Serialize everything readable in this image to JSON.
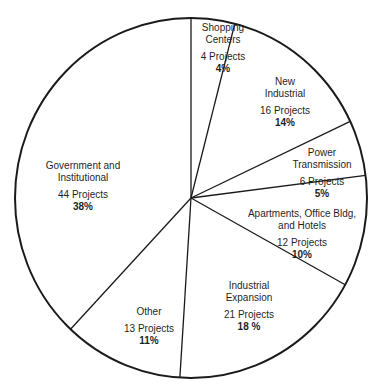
{
  "chart_data": {
    "type": "pie",
    "title": "",
    "start_angle_deg": 0,
    "direction": "clockwise",
    "slices": [
      {
        "label": "Shopping Centers",
        "projects": 4,
        "percent": 4,
        "count_text": "4 Projects",
        "pct_text": "4%"
      },
      {
        "label": "New Industrial",
        "projects": 16,
        "percent": 14,
        "count_text": "16 Projects",
        "pct_text": "14%"
      },
      {
        "label": "Power Transmission",
        "projects": 6,
        "percent": 5,
        "count_text": "6 Projects",
        "pct_text": "5%"
      },
      {
        "label": "Apartments, Office Bldg, and Hotels",
        "projects": 12,
        "percent": 10,
        "count_text": "12 Projects",
        "pct_text": "10%"
      },
      {
        "label": "Industrial Expansion",
        "projects": 21,
        "percent": 18,
        "count_text": "21 Projects",
        "pct_text": "18 %"
      },
      {
        "label": "Other",
        "projects": 13,
        "percent": 11,
        "count_text": "13 Projects",
        "pct_text": "11%"
      },
      {
        "label": "Government and Institutional",
        "projects": 44,
        "percent": 38,
        "count_text": "44 Projects",
        "pct_text": "38%"
      }
    ],
    "total_projects": 116,
    "legend": "none (labels inside slices)",
    "colors": {
      "fill": "#ffffff",
      "stroke": "#1a1a1a"
    }
  },
  "labels": {
    "shopping": {
      "line1": "Shopping",
      "line2": "Centers",
      "count": "4 Projects",
      "pct": "4%"
    },
    "new_industrial": {
      "line1": "New",
      "line2": "Industrial",
      "count": "16 Projects",
      "pct": "14%"
    },
    "power": {
      "line1": "Power",
      "line2": "Transmission",
      "count": "6 Projects",
      "pct": "5%"
    },
    "apartments": {
      "line1": "Apartments, Office Bldg,",
      "line2": "and Hotels",
      "count": "12 Projects",
      "pct": "10%"
    },
    "ind_expansion": {
      "line1": "Industrial",
      "line2": "Expansion",
      "count": "21 Projects",
      "pct": "18 %"
    },
    "other": {
      "line1": "Other",
      "count": "13 Projects",
      "pct": "11%"
    },
    "government": {
      "line1": "Government and",
      "line2": "Institutional",
      "count": "44 Projects",
      "pct": "38%"
    }
  }
}
